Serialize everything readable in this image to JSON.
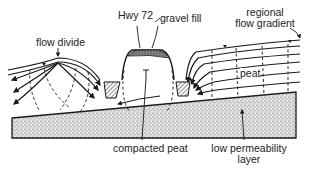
{
  "labels": {
    "hwy": "Hwy 72",
    "gravel_fill": "gravel fill",
    "flow_divide": "flow divide",
    "regional_line1": "regional",
    "regional_line2": "flow gradient",
    "peat": "peat",
    "compacted_peat": "compacted peat",
    "low_perm_line1": "low permeability",
    "low_perm_line2": "layer"
  },
  "colors": {
    "ink": "#1a1a1a",
    "stipple_bg": "#d9d9d9",
    "background": "#ffffff"
  }
}
